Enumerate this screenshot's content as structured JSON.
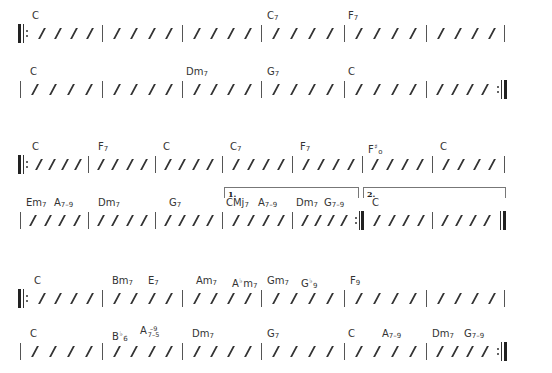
{
  "sections": [
    {
      "name": "section-a",
      "lines": [
        {
          "measures": [
            {
              "chords": [
                {
                  "text": "C"
                }
              ]
            },
            {
              "chords": []
            },
            {
              "chords": []
            },
            {
              "chords": [
                {
                  "text": "C7"
                }
              ]
            },
            {
              "chords": [
                {
                  "text": "F7"
                }
              ]
            },
            {
              "chords": []
            }
          ],
          "start": "repeat-start",
          "end": "single"
        },
        {
          "measures": [
            {
              "chords": [
                {
                  "text": "C"
                }
              ]
            },
            {
              "chords": []
            },
            {
              "chords": [
                {
                  "text": "Dm7"
                }
              ]
            },
            {
              "chords": [
                {
                  "text": "G7"
                }
              ]
            },
            {
              "chords": [
                {
                  "text": "C"
                }
              ]
            },
            {
              "chords": []
            }
          ],
          "start": "single",
          "end": "repeat-end"
        }
      ]
    },
    {
      "name": "section-b",
      "lines": [
        {
          "measures": [
            {
              "chords": [
                {
                  "text": "C"
                }
              ]
            },
            {
              "chords": [
                {
                  "text": "F7"
                }
              ]
            },
            {
              "chords": [
                {
                  "text": "C"
                }
              ]
            },
            {
              "chords": [
                {
                  "text": "C7"
                }
              ]
            },
            {
              "chords": [
                {
                  "text": "F7"
                }
              ]
            },
            {
              "chords": [
                {
                  "text": "F#o"
                }
              ]
            },
            {
              "chords": [
                {
                  "text": "C"
                }
              ]
            }
          ],
          "start": "repeat-start",
          "end": "single"
        },
        {
          "measures": [
            {
              "chords": [
                {
                  "text": "Em7"
                },
                {
                  "text": "A7-9"
                }
              ]
            },
            {
              "chords": [
                {
                  "text": "Dm7"
                }
              ]
            },
            {
              "chords": [
                {
                  "text": "G7"
                }
              ]
            },
            {
              "chords": [
                {
                  "text": "CMj7"
                },
                {
                  "text": "A7-9"
                }
              ]
            },
            {
              "chords": [
                {
                  "text": "Dm7"
                },
                {
                  "text": "G7-9"
                }
              ]
            },
            {
              "chords": [
                {
                  "text": "C"
                }
              ]
            },
            {
              "chords": []
            }
          ],
          "start": "single",
          "end": "final",
          "voltas": [
            {
              "label": "1.",
              "from_measure": 3,
              "to_measure": 4
            },
            {
              "label": "2.",
              "from_measure": 5,
              "to_measure": 6
            }
          ]
        }
      ]
    },
    {
      "name": "section-c",
      "lines": [
        {
          "measures": [
            {
              "chords": [
                {
                  "text": "C"
                }
              ]
            },
            {
              "chords": [
                {
                  "text": "Bm7"
                },
                {
                  "text": "E7"
                }
              ]
            },
            {
              "chords": [
                {
                  "text": "Am7"
                },
                {
                  "text": "Abm7"
                }
              ]
            },
            {
              "chords": [
                {
                  "text": "Gm7"
                },
                {
                  "text": "Gb9"
                }
              ]
            },
            {
              "chords": [
                {
                  "text": "F9"
                }
              ]
            },
            {
              "chords": []
            }
          ],
          "start": "repeat-start",
          "end": "single"
        },
        {
          "measures": [
            {
              "chords": [
                {
                  "text": "C"
                }
              ]
            },
            {
              "chords": [
                {
                  "text": "Bb6"
                },
                {
                  "text": "A7-9-5"
                }
              ]
            },
            {
              "chords": [
                {
                  "text": "Dm7"
                }
              ]
            },
            {
              "chords": [
                {
                  "text": "G7"
                }
              ]
            },
            {
              "chords": [
                {
                  "text": "C"
                },
                {
                  "text": "A7-9"
                }
              ]
            },
            {
              "chords": [
                {
                  "text": "Dm7"
                },
                {
                  "text": "G7-9"
                }
              ]
            }
          ],
          "start": "single",
          "end": "repeat-end"
        }
      ]
    }
  ],
  "beats_per_measure": 4,
  "slash_symbol": "/",
  "colors": {
    "ink": "#333333",
    "barline": "#555555",
    "background": "#ffffff"
  }
}
